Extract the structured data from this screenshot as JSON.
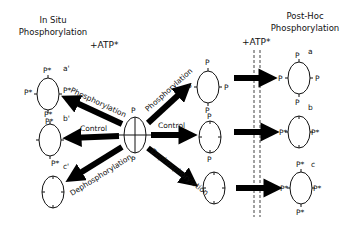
{
  "titles": {
    "left_line1": "In Situ",
    "left_line2": "Phosphorylation",
    "right_line1": "Post-Hoc",
    "right_line2": "Phosphorylation"
  },
  "atp": {
    "left": "+ATP*",
    "right": "+ATP*"
  },
  "arrow_labels": {
    "phosphorylation": "Phosphorylation",
    "control": "Control",
    "dephosphorylation": "Dephosphorylation"
  },
  "center_cell": {
    "top": "P",
    "bottom": "P"
  },
  "in_situ_cells": [
    {
      "label": "a'",
      "top": "P*",
      "left": "P*",
      "right": "P*",
      "bottom": "P*"
    },
    {
      "label": "b'",
      "top": "P*",
      "left": "",
      "right": "",
      "bottom": "P*"
    },
    {
      "label": "c'",
      "top": "",
      "left": "",
      "right": "",
      "bottom": ""
    }
  ],
  "middle_cells": [
    {
      "top": "P",
      "left": "P",
      "right": "P",
      "bottom": "P"
    },
    {
      "top": "P",
      "left": "",
      "right": "",
      "bottom": "P"
    },
    {
      "top": "",
      "left": "",
      "right": "",
      "bottom": ""
    }
  ],
  "post_hoc_cells": [
    {
      "label": "a",
      "top": "P",
      "left": "P",
      "right": "P",
      "bottom": "P"
    },
    {
      "label": "b",
      "top": "",
      "left": "P*",
      "right": "P*",
      "bottom": ""
    },
    {
      "label": "c",
      "top": "P*",
      "left": "P*",
      "right": "P*",
      "bottom": "P*"
    }
  ]
}
